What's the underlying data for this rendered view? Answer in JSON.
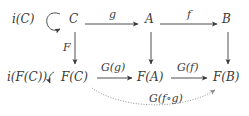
{
  "diagram": {
    "type": "commutative-diagram",
    "nodes": {
      "iC": "i(C)",
      "C": "C",
      "A": "A",
      "B": "B",
      "iFC": "i(F(C))",
      "FC": "F(C)",
      "FA": "F(A)",
      "FB": "F(B)"
    },
    "arrows": {
      "g": "g",
      "f": "f",
      "F": "F",
      "Gg": "G(g)",
      "Gf": "G(f)",
      "Gfg": "G(f∘g)"
    },
    "edges": [
      {
        "from": "C",
        "to": "A",
        "label": "g",
        "style": "solid"
      },
      {
        "from": "A",
        "to": "B",
        "label": "f",
        "style": "solid"
      },
      {
        "from": "C",
        "to": "F(C)",
        "label": "F",
        "style": "solid"
      },
      {
        "from": "A",
        "to": "F(A)",
        "label": "",
        "style": "solid"
      },
      {
        "from": "B",
        "to": "F(B)",
        "label": "",
        "style": "solid"
      },
      {
        "from": "F(C)",
        "to": "F(A)",
        "label": "G(g)",
        "style": "solid"
      },
      {
        "from": "F(A)",
        "to": "F(B)",
        "label": "G(f)",
        "style": "solid"
      },
      {
        "from": "F(C)",
        "to": "F(B)",
        "label": "G(f∘g)",
        "style": "dotted-curved"
      },
      {
        "from": "C",
        "to": "C",
        "label": "i(C)",
        "style": "loop"
      },
      {
        "from": "F(C)",
        "to": "F(C)",
        "label": "i(F(C))",
        "style": "loop"
      }
    ],
    "colors": {
      "ink": "#3a3a3a",
      "dotted": "#8a8a8a",
      "background": "#ffffff"
    }
  }
}
